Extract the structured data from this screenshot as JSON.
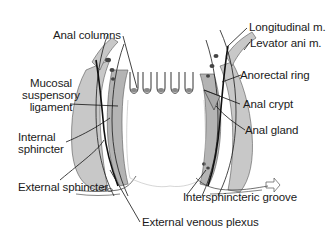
{
  "diagram": {
    "colors": {
      "background": "#ffffff",
      "muscle_fill": "#c8c8c8",
      "muscle_dark": "#a9a9a9",
      "outline": "#1a1a1a",
      "text": "#1a1a1a"
    },
    "labels": {
      "anal_columns": "Anal columns",
      "mucosal_line1": "Mucosal",
      "mucosal_line2": "suspensory",
      "mucosal_line3": "ligament",
      "internal_line1": "Internal",
      "internal_line2": "sphincter",
      "external_sphincter": "External sphincter",
      "external_venous_plexus": "External venous plexus",
      "longitudinal": "Longitudinal m.",
      "levator_ani": "Levator ani m.",
      "anorectal_ring": "Anorectal ring",
      "anal_crypt": "Anal crypt",
      "anal_gland": "Anal gland",
      "intersphincteric_groove": "Intersphincteric groove"
    }
  }
}
